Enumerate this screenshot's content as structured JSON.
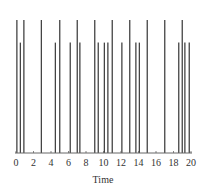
{
  "chart_data": {
    "type": "bar",
    "title": "",
    "xlabel": "Time",
    "ylabel": "",
    "xlim": [
      0,
      20
    ],
    "ylim": [
      0,
      1
    ],
    "grid": false,
    "xticks": [
      0,
      2,
      4,
      6,
      8,
      10,
      12,
      14,
      16,
      18,
      20
    ],
    "xtick_labels": [
      "0",
      "2",
      "4",
      "6",
      "8",
      "10",
      "12",
      "14",
      "16",
      "18",
      "20"
    ],
    "series": [
      {
        "name": "tall spikes",
        "height": 1.0,
        "x": [
          0.1,
          0.9,
          2.9,
          5.0,
          7.0,
          9.0,
          11.0,
          13.0,
          15.0,
          17.0,
          19.0
        ]
      },
      {
        "name": "short spikes",
        "height": 0.83,
        "x": [
          0.5,
          4.5,
          6.2,
          7.3,
          9.4,
          10.1,
          10.5,
          12.1,
          13.7,
          14.1,
          18.6,
          19.3,
          19.8
        ]
      }
    ],
    "colors": {
      "spike": "#444444",
      "axis": "#666666",
      "text": "#333333"
    }
  }
}
